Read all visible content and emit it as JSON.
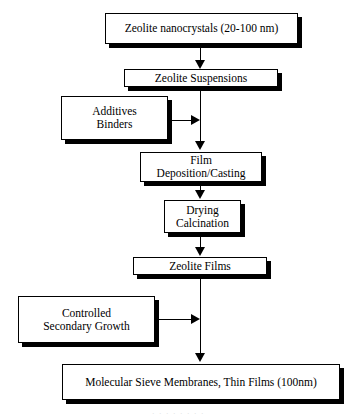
{
  "diagram": {
    "type": "process-flowchart",
    "background_color": "#ffffff",
    "line_color": "#000000",
    "box_fill_color": "#ffffff",
    "nodes": [
      {
        "id": "zeolite-nanocrystals",
        "label": "Zeolite nanocrystals (20-100 nm)",
        "x": 105,
        "y": 13,
        "w": 193,
        "h": 31,
        "font_size": 11.5
      },
      {
        "id": "zeolite-suspensions",
        "label": "Zeolite Suspensions",
        "x": 124,
        "y": 69,
        "w": 154,
        "h": 18,
        "font_size": 11.5
      },
      {
        "id": "additives-binders",
        "label": "Additives\nBinders",
        "x": 61,
        "y": 96,
        "w": 107,
        "h": 44,
        "font_size": 11.5
      },
      {
        "id": "film-deposition-casting",
        "label": "Film Deposition/Casting",
        "x": 140,
        "y": 152,
        "w": 122,
        "h": 30,
        "font_size": 11.5
      },
      {
        "id": "drying-calcination",
        "label": "Drying\nCalcination",
        "x": 164,
        "y": 200,
        "w": 77,
        "h": 33,
        "font_size": 11.5
      },
      {
        "id": "zeolite-films",
        "label": "Zeolite Films",
        "x": 133,
        "y": 257,
        "w": 134,
        "h": 18,
        "font_size": 11.5
      },
      {
        "id": "controlled-secondary-growth",
        "label": "Controlled\nSecondary Growth",
        "x": 18,
        "y": 296,
        "w": 137,
        "h": 47,
        "font_size": 11.5
      },
      {
        "id": "molecular-sieve-membranes",
        "label": "Molecular Sieve Membranes, Thin Films (100nm)",
        "x": 62,
        "y": 364,
        "w": 278,
        "h": 36,
        "font_size": 11.5
      }
    ],
    "connectors": [
      {
        "id": "nanocrystals-to-suspensions",
        "from": "zeolite-nanocrystals",
        "to": "zeolite-suspensions",
        "direction": "down"
      },
      {
        "id": "suspensions-to-deposition",
        "from": "zeolite-suspensions",
        "to": "film-deposition-casting",
        "direction": "down"
      },
      {
        "id": "additives-to-trunk",
        "from": "additives-binders",
        "to": "film-deposition-casting",
        "direction": "right"
      },
      {
        "id": "deposition-to-drying",
        "from": "film-deposition-casting",
        "to": "drying-calcination",
        "direction": "down"
      },
      {
        "id": "drying-to-films",
        "from": "drying-calcination",
        "to": "zeolite-films",
        "direction": "down"
      },
      {
        "id": "films-to-membranes",
        "from": "zeolite-films",
        "to": "molecular-sieve-membranes",
        "direction": "down"
      },
      {
        "id": "secondary-growth-to-trunk",
        "from": "controlled-secondary-growth",
        "to": "molecular-sieve-membranes",
        "direction": "right"
      }
    ],
    "caption_remnant": ". . . . . . . ."
  }
}
